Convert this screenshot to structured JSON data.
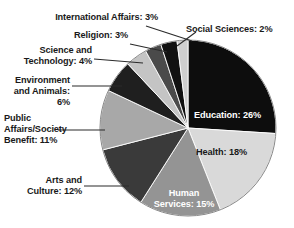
{
  "chart_data": {
    "type": "pie",
    "title": "",
    "subtitle": "",
    "xlabel": "",
    "ylabel": "",
    "legend_position": "none",
    "grid": false,
    "units": "percent",
    "start_angle_deg": 0,
    "direction": "clockwise",
    "categories": [
      "Education",
      "Health",
      "Human Services",
      "Arts and Culture",
      "Public Affairs/Society Benefit",
      "Environment and Animals",
      "Science and Technology",
      "Religion",
      "International Affairs",
      "Social Sciences"
    ],
    "values": [
      26,
      18,
      15,
      12,
      11,
      6,
      4,
      3,
      3,
      2
    ],
    "total": 100,
    "colors": [
      "#0d0d0d",
      "#d9d9d9",
      "#949494",
      "#3a3a3a",
      "#a8a8a8",
      "#1f1f1f",
      "#c4c4c4",
      "#4a4a4a",
      "#111111",
      "#cfcfcf"
    ],
    "slices": [
      {
        "label": "Education",
        "value": 26,
        "display": "Education: 26%",
        "color": "#0d0d0d",
        "label_placement": "inside",
        "text_color": "#ffffff"
      },
      {
        "label": "Health",
        "value": 18,
        "display": "Health: 18%",
        "color": "#d9d9d9",
        "label_placement": "inside",
        "text_color": "#1a1a1a"
      },
      {
        "label": "Human Services",
        "value": 15,
        "display": "Human\nServices: 15%",
        "color": "#949494",
        "label_placement": "inside",
        "text_color": "#ffffff"
      },
      {
        "label": "Arts and Culture",
        "value": 12,
        "display": "Arts and\nCulture: 12%",
        "color": "#3a3a3a",
        "label_placement": "outside",
        "text_color": "#1a1a1a"
      },
      {
        "label": "Public Affairs/Society Benefit",
        "value": 11,
        "display": "Public\nAffairs/Society\nBenefit: 11%",
        "color": "#a8a8a8",
        "label_placement": "outside",
        "text_color": "#1a1a1a"
      },
      {
        "label": "Environment and Animals",
        "value": 6,
        "display": "Environment\nand Animals: 6%",
        "color": "#1f1f1f",
        "label_placement": "outside",
        "text_color": "#1a1a1a"
      },
      {
        "label": "Science and Technology",
        "value": 4,
        "display": "Science and\nTechnology: 4%",
        "color": "#c4c4c4",
        "label_placement": "outside",
        "text_color": "#1a1a1a"
      },
      {
        "label": "Religion",
        "value": 3,
        "display": "Religion: 3%",
        "color": "#4a4a4a",
        "label_placement": "outside",
        "text_color": "#1a1a1a"
      },
      {
        "label": "International Affairs",
        "value": 3,
        "display": "International Affairs: 3%",
        "color": "#111111",
        "label_placement": "outside",
        "text_color": "#1a1a1a"
      },
      {
        "label": "Social Sciences",
        "value": 2,
        "display": "Social Sciences: 2%",
        "color": "#cfcfcf",
        "label_placement": "outside",
        "text_color": "#1a1a1a"
      }
    ]
  },
  "labels": {
    "education": "Education: 26%",
    "health": "Health: 18%",
    "human_services": "Human\nServices: 15%",
    "arts_culture": "Arts and\nCulture: 12%",
    "public_affairs": "Public\nAffairs/Society\nBenefit: 11%",
    "environment": "Environment\nand Animals: 6%",
    "science_tech": "Science and\nTechnology: 4%",
    "religion": "Religion: 3%",
    "international": "International Affairs: 3%",
    "social_sciences": "Social Sciences: 2%"
  },
  "style": {
    "background": "#ffffff",
    "leader_line_color": "#2b2b2b",
    "pie_outline_color": "#8a8a8a"
  }
}
